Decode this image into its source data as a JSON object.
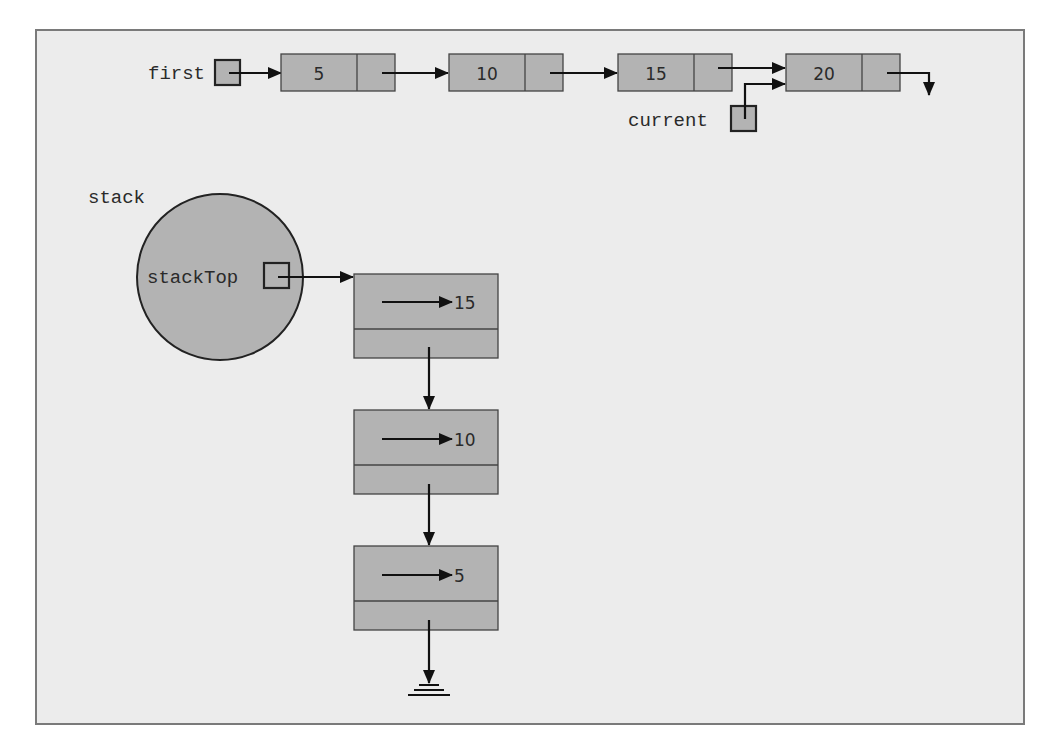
{
  "diagram": {
    "type": "linked-list-and-linked-stack",
    "list": {
      "head_label": "first",
      "nodes": [
        {
          "value": "5"
        },
        {
          "value": "10"
        },
        {
          "value": "15"
        },
        {
          "value": "20"
        }
      ],
      "current_label": "current",
      "current_points_to_index": 3
    },
    "stack": {
      "label": "stack",
      "top_label": "stackTop",
      "nodes": [
        {
          "info_points_to": "15"
        },
        {
          "info_points_to": "10"
        },
        {
          "info_points_to": "5"
        }
      ],
      "terminator": "ground"
    },
    "colors": {
      "background": "#ececec",
      "node_fill": "#b3b3b3",
      "border": "#7a7a7a",
      "line": "#111111"
    }
  }
}
